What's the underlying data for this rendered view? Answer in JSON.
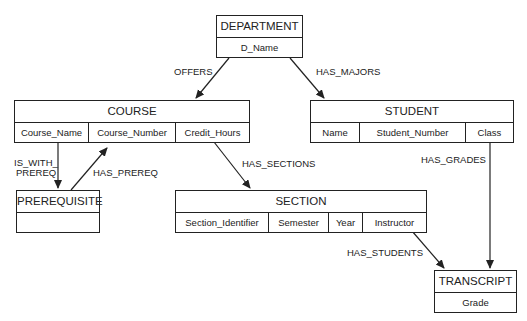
{
  "entities": {
    "department": {
      "name": "DEPARTMENT",
      "attributes": [
        "D_Name"
      ]
    },
    "course": {
      "name": "COURSE",
      "attributes": [
        "Course_Name",
        "Course_Number",
        "Credit_Hours"
      ]
    },
    "student": {
      "name": "STUDENT",
      "attributes": [
        "Name",
        "Student_Number",
        "Class"
      ]
    },
    "prerequisite": {
      "name": "PREREQUISITE",
      "attributes": [
        ""
      ]
    },
    "section": {
      "name": "SECTION",
      "attributes": [
        "Section_Identifier",
        "Semester",
        "Year",
        "Instructor"
      ]
    },
    "transcript": {
      "name": "TRANSCRIPT",
      "attributes": [
        "Grade"
      ]
    }
  },
  "relationships": {
    "offers": "OFFERS",
    "has_majors": "HAS_MAJORS",
    "is_with_prereq_1": "IS_WITH_",
    "is_with_prereq_2": "PREREQ",
    "has_prereq": "HAS_PREREQ",
    "has_sections": "HAS_SECTIONS",
    "has_grades": "HAS_GRADES",
    "has_students": "HAS_STUDENTS"
  },
  "colors": {
    "line": "#222222",
    "background": "#ffffff"
  }
}
